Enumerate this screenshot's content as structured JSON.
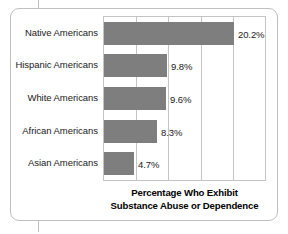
{
  "figure": {
    "frame_color": "#bfbfbf",
    "plot_border_color": "#c4c4c4",
    "bar_color": "#7e7e7e",
    "text_color": "#1a1a1a"
  },
  "axis_title": {
    "line1": "Percentage Who Exhibit",
    "line2": "Substance Abuse or Dependence"
  },
  "chart_data": {
    "type": "bar",
    "orientation": "horizontal",
    "title": "Percentage Who Exhibit Substance Abuse or Dependence",
    "xlabel": "Percentage Who Exhibit Substance Abuse or Dependence",
    "ylabel": "",
    "categories": [
      "Native Americans",
      "Hispanic Americans",
      "White Americans",
      "African Americans",
      "Asian Americans"
    ],
    "values": [
      20.2,
      9.8,
      9.6,
      8.3,
      4.7
    ],
    "value_labels": [
      "20.2%",
      "9.8%",
      "9.6%",
      "8.3%",
      "4.7%"
    ],
    "xlim": [
      0,
      25
    ],
    "xticks": [
      0,
      5,
      10,
      15,
      20,
      25
    ],
    "tick_labels_shown": false,
    "grid": "vertical",
    "legend": "none",
    "bar_color": "#7e7e7e"
  }
}
